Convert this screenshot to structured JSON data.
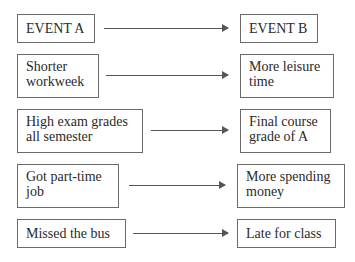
{
  "diagram": {
    "type": "cause-effect pairs",
    "rows": [
      {
        "cause": "EVENT A",
        "effect": "EVENT B"
      },
      {
        "cause": "Shorter\nworkweek",
        "effect": "More leisure\ntime"
      },
      {
        "cause": "High exam grades\nall semester",
        "effect": "Final course\ngrade of A"
      },
      {
        "cause": "Got part-time\njob",
        "effect": "More spending\nmoney"
      },
      {
        "cause": "Missed the bus",
        "effect": "Late for class"
      }
    ]
  }
}
